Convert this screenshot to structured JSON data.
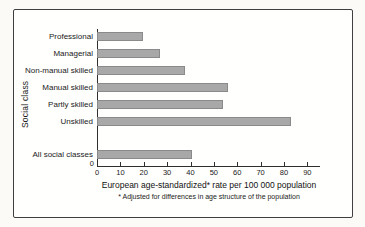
{
  "chart_data": {
    "type": "bar",
    "orientation": "horizontal",
    "categories": [
      "Professional",
      "Managerial",
      "Non-manual skilled",
      "Manual skilled",
      "Partly skilled",
      "Unskilled",
      "All social classes"
    ],
    "values": [
      19,
      26,
      37,
      55,
      53,
      82,
      40
    ],
    "xticks": [
      0,
      10,
      20,
      30,
      40,
      50,
      60,
      70,
      80,
      90
    ],
    "xlim": [
      0,
      95
    ],
    "xlabel": "European age-standardized* rate per 100 000 population",
    "footnote": "* Adjusted for differences in age structure of the population",
    "ylabel": "Social class",
    "y_axis_zero_label": "0",
    "grid": "off",
    "legend": "none",
    "bar_color": "#a8a8a8",
    "bar_border_color": "#8a8a8a",
    "axis_color": "#2f2f2f"
  }
}
